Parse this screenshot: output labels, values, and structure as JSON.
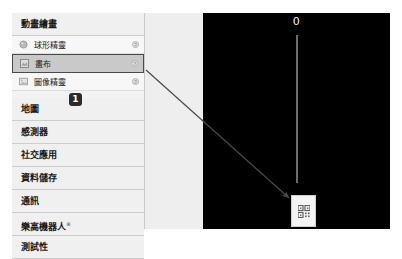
{
  "palette": {
    "section_header": "動畫繪畫",
    "components": [
      {
        "label": "球形精靈",
        "icon": "ball-sprite-icon",
        "help": "?",
        "selected": false
      },
      {
        "label": "畫布",
        "icon": "canvas-icon",
        "help": "?",
        "selected": true
      },
      {
        "label": "圖像精靈",
        "icon": "image-sprite-icon",
        "help": "?",
        "selected": false
      }
    ],
    "categories": [
      {
        "label": "地圖",
        "registered": ""
      },
      {
        "label": "感測器",
        "registered": ""
      },
      {
        "label": "社交應用",
        "registered": ""
      },
      {
        "label": "資料儲存",
        "registered": ""
      },
      {
        "label": "通訊",
        "registered": ""
      },
      {
        "label": "樂高機器人",
        "registered": "®"
      },
      {
        "label": "測試性",
        "registered": ""
      }
    ]
  },
  "viewer": {
    "title": "0",
    "background": "#000000",
    "dropped_component_icon": "qr-code-icon"
  },
  "annotation": {
    "step_number": "1",
    "arrow_color": "#4a4a4a"
  },
  "colors": {
    "selected_row_fill": "#c9c9c9",
    "selected_row_border": "#4a4a4a",
    "panel_background": "#f3f3f3",
    "badge_background": "#2b2b2b"
  }
}
